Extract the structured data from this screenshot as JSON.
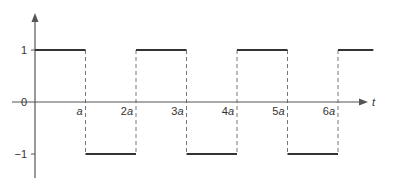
{
  "chart_data": {
    "type": "line",
    "title": "",
    "subtitle": "",
    "xlabel": "t",
    "ylabel": "",
    "x_tick_labels": [
      "a",
      "2a",
      "3a",
      "4a",
      "5a",
      "6a"
    ],
    "x_ticks": [
      1,
      2,
      3,
      4,
      5,
      6
    ],
    "y_tick_labels": [
      "1",
      "0",
      "−1"
    ],
    "y_ticks": [
      1,
      0,
      -1
    ],
    "xlim": [
      0,
      6.7
    ],
    "ylim": [
      -1.5,
      1.5
    ],
    "grid": false,
    "legend": null,
    "series": [
      {
        "name": "square wave",
        "segments": [
          {
            "x_start": 0,
            "x_end": 1,
            "y": 1
          },
          {
            "x_start": 1,
            "x_end": 2,
            "y": -1
          },
          {
            "x_start": 2,
            "x_end": 3,
            "y": 1
          },
          {
            "x_start": 3,
            "x_end": 4,
            "y": -1
          },
          {
            "x_start": 4,
            "x_end": 5,
            "y": 1
          },
          {
            "x_start": 5,
            "x_end": 6,
            "y": -1
          },
          {
            "x_start": 6,
            "x_end": 6.7,
            "y": 1
          }
        ],
        "transitions_dashed": true
      }
    ],
    "colors": {
      "axis": "#555555",
      "signal": "#333333",
      "dashed": "#777777",
      "text": "#333333"
    }
  }
}
